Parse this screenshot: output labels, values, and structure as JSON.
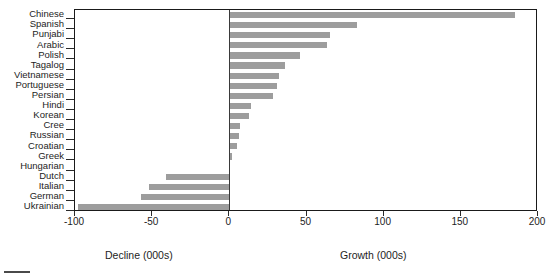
{
  "chart_data": {
    "type": "bar",
    "orientation": "horizontal",
    "title": "",
    "xlabel": "",
    "ylabel": "",
    "xlim": [
      -100,
      200
    ],
    "xticks": [
      -100,
      -50,
      0,
      50,
      100,
      150,
      200
    ],
    "xtick_labels": [
      "-100",
      "-50",
      "0",
      "50",
      "100",
      "150",
      "200"
    ],
    "grid": false,
    "legend": false,
    "zero_reference": 0,
    "bar_color": "#9d9d9d",
    "axis_color": "#1a1a1a",
    "units": "thousands of speakers (000s)",
    "categories": [
      "Chinese",
      "Spanish",
      "Punjabi",
      "Arabic",
      "Polish",
      "Tagalog",
      "Vietnamese",
      "Portuguese",
      "Persian",
      "Hindi",
      "Korean",
      "Cree",
      "Russian",
      "Croatian",
      "Greek",
      "Hungarian",
      "Dutch",
      "Italian",
      "German",
      "Ukrainian"
    ],
    "values": [
      185,
      83,
      65,
      63,
      46,
      36,
      32,
      31,
      28,
      14,
      13,
      7,
      6,
      5,
      2,
      0,
      -41,
      -52,
      -57,
      -98
    ],
    "captions": {
      "decline": "Decline (000s)",
      "growth": "Growth (000s)"
    }
  }
}
